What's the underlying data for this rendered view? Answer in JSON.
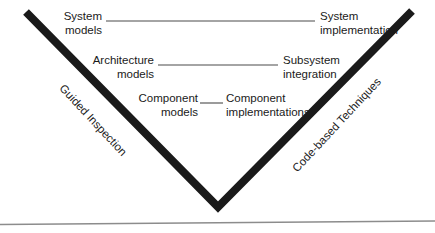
{
  "diagram": {
    "type": "v-model",
    "colors": {
      "stroke": "#1a1a1a",
      "connector": "#4a4a4a",
      "baseline": "#8c8c8c",
      "background": "#ffffff",
      "text": "#1a1a1a"
    },
    "v_shape": {
      "left_top": {
        "x": 26,
        "y": 12
      },
      "vertex": {
        "x": 218,
        "y": 207
      },
      "right_top": {
        "x": 412,
        "y": 11
      },
      "stroke_width": 8
    },
    "baseline": {
      "left": {
        "x": 0,
        "y": 224
      },
      "right": {
        "x": 435,
        "y": 221
      },
      "stroke_width": 1.3
    },
    "levels": [
      {
        "id": "level-system",
        "left_label": "System\nmodels",
        "left_line1": "System",
        "left_line2": "models",
        "right_line1": "System",
        "right_line2": "implementation",
        "connector": {
          "x1": 106,
          "y1": 21,
          "x2": 315,
          "y2": 21
        }
      },
      {
        "id": "level-architecture",
        "left_line1": "Architecture",
        "left_line2": "models",
        "right_line1": "Subsystem",
        "right_line2": "integration",
        "connector": {
          "x1": 158,
          "y1": 65,
          "x2": 278,
          "y2": 65
        }
      },
      {
        "id": "level-component",
        "left_line1": "Component",
        "left_line2": "models",
        "right_line1": "Component",
        "right_line2": "implementations",
        "connector": {
          "x1": 200,
          "y1": 103,
          "x2": 223,
          "y2": 103
        }
      }
    ],
    "side_labels": {
      "left": "Guided Inspection",
      "right": "Code-based Techniques"
    }
  }
}
